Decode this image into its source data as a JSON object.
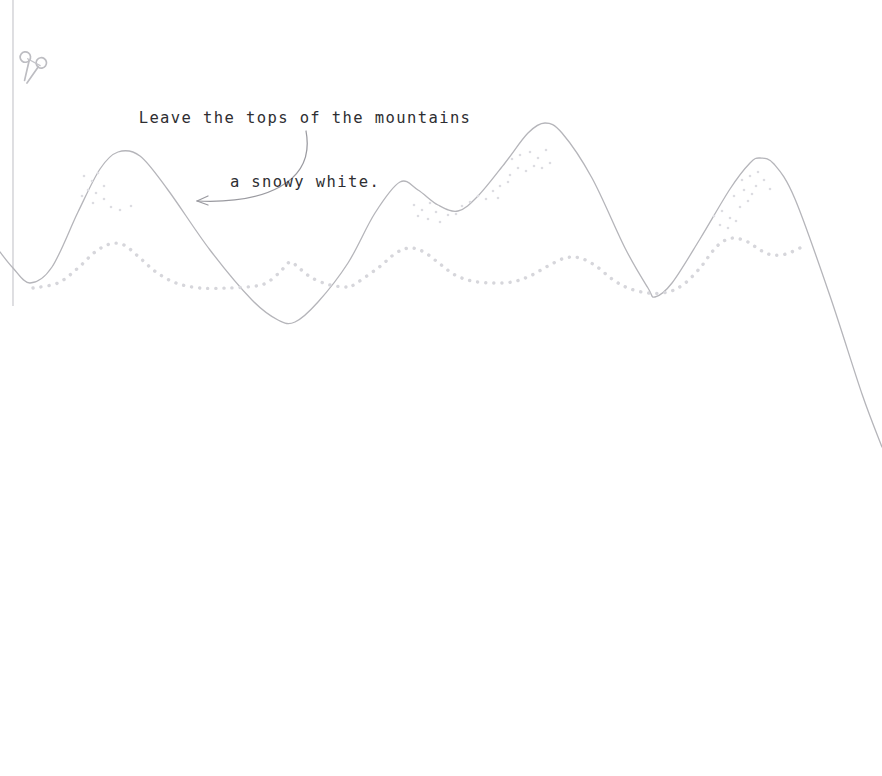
{
  "page": {
    "width": 882,
    "height": 776,
    "background_color": "#ffffff",
    "kind": "coloring-worksheet"
  },
  "instruction": {
    "full_text": "Leave the tops of the mountains a snowy white.",
    "line_1": "Leave the tops of the mountains",
    "line_2": "a snowy white.",
    "color": "#2e2e32"
  },
  "icons": {
    "scissors": {
      "name": "scissors-icon",
      "glyph": "✂",
      "color": "#b9b9bd",
      "x": 30,
      "y": 60
    }
  },
  "cut_line": {
    "name": "cut-guide-line",
    "color": "#c9c9ce",
    "x": 13,
    "y_start": 0,
    "y_end": 306
  },
  "arrow": {
    "name": "callout-arrow",
    "color": "#9a9aa0",
    "start": [
      306,
      131
    ],
    "end": [
      197,
      201
    ],
    "control_1": [
      316,
      184
    ],
    "control_2": [
      262,
      204
    ]
  },
  "chart_data": {
    "type": "line",
    "xlabel": "",
    "ylabel": "",
    "xlim": [
      0,
      882
    ],
    "ylim": [
      776,
      0
    ],
    "grid": false,
    "legend": "none",
    "series": [
      {
        "name": "mountain-ridge",
        "style": "solid",
        "color": "#b5b5ba",
        "width": 1.3,
        "points": [
          [
            0,
            252
          ],
          [
            13,
            268
          ],
          [
            30,
            283
          ],
          [
            52,
            267
          ],
          [
            78,
            212
          ],
          [
            100,
            169
          ],
          [
            118,
            152
          ],
          [
            140,
            156
          ],
          [
            168,
            190
          ],
          [
            210,
            250
          ],
          [
            252,
            300
          ],
          [
            278,
            320
          ],
          [
            295,
            322
          ],
          [
            318,
            302
          ],
          [
            348,
            263
          ],
          [
            375,
            213
          ],
          [
            400,
            182
          ],
          [
            418,
            190
          ],
          [
            438,
            205
          ],
          [
            458,
            211
          ],
          [
            478,
            196
          ],
          [
            505,
            163
          ],
          [
            528,
            133
          ],
          [
            545,
            123
          ],
          [
            562,
            133
          ],
          [
            592,
            178
          ],
          [
            625,
            248
          ],
          [
            648,
            288
          ],
          [
            655,
            297
          ],
          [
            672,
            283
          ],
          [
            700,
            239
          ],
          [
            730,
            189
          ],
          [
            750,
            163
          ],
          [
            760,
            158
          ],
          [
            774,
            164
          ],
          [
            795,
            199
          ],
          [
            830,
            296
          ],
          [
            862,
            394
          ],
          [
            882,
            447
          ]
        ]
      },
      {
        "name": "snow-line-dotted",
        "style": "dotted",
        "color": "#d6d6db",
        "width": 3.4,
        "points": [
          [
            33,
            288
          ],
          [
            58,
            283
          ],
          [
            78,
            268
          ],
          [
            95,
            252
          ],
          [
            110,
            244
          ],
          [
            124,
            245
          ],
          [
            140,
            258
          ],
          [
            156,
            272
          ],
          [
            176,
            283
          ],
          [
            200,
            288
          ],
          [
            228,
            288
          ],
          [
            256,
            286
          ],
          [
            268,
            282
          ],
          [
            280,
            272
          ],
          [
            290,
            262
          ],
          [
            299,
            268
          ],
          [
            312,
            278
          ],
          [
            330,
            285
          ],
          [
            346,
            287
          ],
          [
            352,
            286
          ],
          [
            378,
            268
          ],
          [
            396,
            253
          ],
          [
            410,
            248
          ],
          [
            424,
            252
          ],
          [
            440,
            264
          ],
          [
            455,
            275
          ],
          [
            472,
            281
          ],
          [
            492,
            283
          ],
          [
            512,
            282
          ],
          [
            530,
            276
          ],
          [
            548,
            266
          ],
          [
            565,
            258
          ],
          [
            580,
            258
          ],
          [
            596,
            266
          ],
          [
            612,
            279
          ],
          [
            628,
            288
          ],
          [
            648,
            293
          ],
          [
            668,
            292
          ],
          [
            684,
            284
          ],
          [
            700,
            268
          ],
          [
            712,
            252
          ],
          [
            722,
            242
          ],
          [
            734,
            238
          ],
          [
            748,
            242
          ],
          [
            760,
            250
          ],
          [
            772,
            255
          ],
          [
            786,
            254
          ],
          [
            800,
            248
          ]
        ]
      }
    ],
    "snow_dots": {
      "name": "snow-speckles",
      "color": "#dcdce1",
      "radius": 1.3,
      "points": [
        [
          84,
          176
        ],
        [
          92,
          181
        ],
        [
          98,
          173
        ],
        [
          88,
          190
        ],
        [
          96,
          193
        ],
        [
          104,
          186
        ],
        [
          82,
          196
        ],
        [
          93,
          203
        ],
        [
          104,
          199
        ],
        [
          111,
          207
        ],
        [
          120,
          210
        ],
        [
          131,
          206
        ],
        [
          414,
          205
        ],
        [
          422,
          210
        ],
        [
          430,
          203
        ],
        [
          418,
          216
        ],
        [
          428,
          219
        ],
        [
          436,
          212
        ],
        [
          440,
          222
        ],
        [
          448,
          215
        ],
        [
          456,
          214
        ],
        [
          462,
          206
        ],
        [
          470,
          202
        ],
        [
          478,
          196
        ],
        [
          486,
          199
        ],
        [
          493,
          191
        ],
        [
          500,
          186
        ],
        [
          508,
          182
        ],
        [
          498,
          198
        ],
        [
          510,
          175
        ],
        [
          518,
          168
        ],
        [
          526,
          171
        ],
        [
          512,
          159
        ],
        [
          520,
          155
        ],
        [
          530,
          152
        ],
        [
          538,
          158
        ],
        [
          546,
          150
        ],
        [
          534,
          166
        ],
        [
          542,
          168
        ],
        [
          550,
          163
        ],
        [
          714,
          216
        ],
        [
          722,
          211
        ],
        [
          730,
          218
        ],
        [
          720,
          225
        ],
        [
          728,
          228
        ],
        [
          736,
          221
        ],
        [
          740,
          207
        ],
        [
          748,
          201
        ],
        [
          734,
          196
        ],
        [
          744,
          190
        ],
        [
          752,
          194
        ],
        [
          742,
          180
        ],
        [
          750,
          176
        ],
        [
          758,
          172
        ],
        [
          764,
          180
        ],
        [
          756,
          186
        ],
        [
          770,
          189
        ]
      ]
    }
  }
}
